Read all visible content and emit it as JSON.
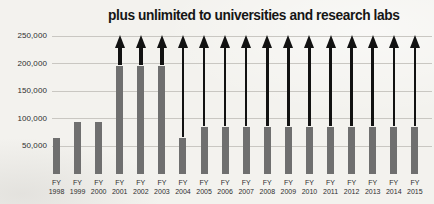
{
  "title": "plus unlimited to universities and research labs",
  "chart_data": {
    "type": "bar",
    "title": "plus unlimited to universities and research labs",
    "x_prefix": "FY",
    "categories": [
      "1998",
      "1999",
      "2000",
      "2001",
      "2002",
      "2003",
      "2004",
      "2005",
      "2006",
      "2007",
      "2008",
      "2009",
      "2010",
      "2011",
      "2012",
      "2013",
      "2014",
      "2015"
    ],
    "values": [
      65000,
      95000,
      95000,
      195000,
      195000,
      195000,
      65000,
      85000,
      85000,
      85000,
      85000,
      85000,
      85000,
      85000,
      85000,
      85000,
      85000,
      85000
    ],
    "arrows": [
      false,
      false,
      false,
      true,
      true,
      true,
      true,
      true,
      true,
      true,
      true,
      true,
      true,
      true,
      true,
      true,
      true,
      true
    ],
    "arrow_top_value": 250000,
    "yticks": [
      50000,
      100000,
      150000,
      200000,
      250000
    ],
    "ylim": [
      0,
      250000
    ],
    "grid": true,
    "legend": null,
    "xlabel": "",
    "ylabel": "",
    "colors": {
      "bar": "#6f6f6f",
      "grid": "#c9c7c2",
      "arrow": "#121212",
      "tick_text": "#2e2e2e",
      "title_text": "#161616"
    }
  }
}
